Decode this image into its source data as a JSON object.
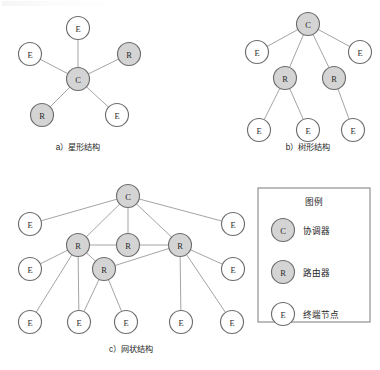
{
  "figure": {
    "captions": {
      "star": "a）星形结构",
      "tree": "b）树形结构",
      "mesh": "c）网状结构"
    },
    "node_symbols": {
      "coordinator": "C",
      "router": "R",
      "endnode": "E"
    },
    "colors": {
      "filled_node": "#d4d4d4",
      "empty_node": "#ffffff",
      "node_stroke": "#6e6e6e",
      "edge": "#9a9a9a",
      "text": "#1f1f1f",
      "legend_border": "#7a7a7a"
    }
  },
  "legend": {
    "title": "图例",
    "entries": [
      {
        "symbol": "C",
        "label": "协调器",
        "type": "coordinator"
      },
      {
        "symbol": "R",
        "label": "路由器",
        "type": "router"
      },
      {
        "symbol": "E",
        "label": "终端节点",
        "type": "endnode"
      }
    ]
  },
  "chart_data": {
    "type": "diagram",
    "subfigures": [
      {
        "id": "star",
        "caption": "a）星形结构",
        "caption_pos": {
          "x": 78,
          "y": 150
        },
        "nodes": [
          {
            "id": "s_c",
            "label": "C",
            "type": "coordinator",
            "x": 78,
            "y": 79
          },
          {
            "id": "s_e1",
            "label": "E",
            "type": "endnode",
            "x": 78,
            "y": 28
          },
          {
            "id": "s_e2",
            "label": "E",
            "type": "endnode",
            "x": 30,
            "y": 54
          },
          {
            "id": "s_r1",
            "label": "R",
            "type": "router",
            "x": 129,
            "y": 54
          },
          {
            "id": "s_r2",
            "label": "R",
            "type": "router",
            "x": 42,
            "y": 115
          },
          {
            "id": "s_e3",
            "label": "E",
            "type": "endnode",
            "x": 117,
            "y": 115
          }
        ],
        "edges": [
          [
            "s_c",
            "s_e1"
          ],
          [
            "s_c",
            "s_e2"
          ],
          [
            "s_c",
            "s_r1"
          ],
          [
            "s_c",
            "s_r2"
          ],
          [
            "s_c",
            "s_e3"
          ]
        ]
      },
      {
        "id": "tree",
        "caption": "b）树形结构",
        "caption_pos": {
          "x": 308,
          "y": 150
        },
        "nodes": [
          {
            "id": "t_c",
            "label": "C",
            "type": "coordinator",
            "x": 308,
            "y": 24
          },
          {
            "id": "t_e1",
            "label": "E",
            "type": "endnode",
            "x": 257,
            "y": 52
          },
          {
            "id": "t_e2",
            "label": "E",
            "type": "endnode",
            "x": 360,
            "y": 52
          },
          {
            "id": "t_r1",
            "label": "R",
            "type": "router",
            "x": 285,
            "y": 78
          },
          {
            "id": "t_r2",
            "label": "R",
            "type": "router",
            "x": 334,
            "y": 78
          },
          {
            "id": "t_e3",
            "label": "E",
            "type": "endnode",
            "x": 259,
            "y": 130
          },
          {
            "id": "t_e4",
            "label": "E",
            "type": "endnode",
            "x": 308,
            "y": 130
          },
          {
            "id": "t_e5",
            "label": "E",
            "type": "endnode",
            "x": 353,
            "y": 130
          }
        ],
        "edges": [
          [
            "t_c",
            "t_e1"
          ],
          [
            "t_c",
            "t_e2"
          ],
          [
            "t_c",
            "t_r1"
          ],
          [
            "t_c",
            "t_r2"
          ],
          [
            "t_r1",
            "t_e3"
          ],
          [
            "t_r1",
            "t_e4"
          ],
          [
            "t_r2",
            "t_e5"
          ]
        ]
      },
      {
        "id": "mesh",
        "caption": "c）网状结构",
        "caption_pos": {
          "x": 131,
          "y": 352
        },
        "nodes": [
          {
            "id": "m_c",
            "label": "C",
            "type": "coordinator",
            "x": 128,
            "y": 196
          },
          {
            "id": "m_e1",
            "label": "E",
            "type": "endnode",
            "x": 30,
            "y": 224
          },
          {
            "id": "m_e2",
            "label": "E",
            "type": "endnode",
            "x": 233,
            "y": 224
          },
          {
            "id": "m_r1",
            "label": "R",
            "type": "router",
            "x": 78,
            "y": 245
          },
          {
            "id": "m_r2",
            "label": "R",
            "type": "router",
            "x": 128,
            "y": 245
          },
          {
            "id": "m_r3",
            "label": "R",
            "type": "router",
            "x": 180,
            "y": 245
          },
          {
            "id": "m_r4",
            "label": "R",
            "type": "router",
            "x": 104,
            "y": 269
          },
          {
            "id": "m_e3",
            "label": "E",
            "type": "endnode",
            "x": 30,
            "y": 269
          },
          {
            "id": "m_e4",
            "label": "E",
            "type": "endnode",
            "x": 233,
            "y": 269
          },
          {
            "id": "m_e5",
            "label": "E",
            "type": "endnode",
            "x": 30,
            "y": 322
          },
          {
            "id": "m_e6",
            "label": "E",
            "type": "endnode",
            "x": 79,
            "y": 322
          },
          {
            "id": "m_e7",
            "label": "E",
            "type": "endnode",
            "x": 126,
            "y": 322
          },
          {
            "id": "m_e8",
            "label": "E",
            "type": "endnode",
            "x": 181,
            "y": 322
          },
          {
            "id": "m_e9",
            "label": "E",
            "type": "endnode",
            "x": 232,
            "y": 322
          }
        ],
        "edges": [
          [
            "m_c",
            "m_e1"
          ],
          [
            "m_c",
            "m_e2"
          ],
          [
            "m_c",
            "m_r1"
          ],
          [
            "m_c",
            "m_r2"
          ],
          [
            "m_c",
            "m_r3"
          ],
          [
            "m_r1",
            "m_r2"
          ],
          [
            "m_r2",
            "m_r3"
          ],
          [
            "m_r1",
            "m_r4"
          ],
          [
            "m_r4",
            "m_r3"
          ],
          [
            "m_r1",
            "m_e3"
          ],
          [
            "m_r1",
            "m_e5"
          ],
          [
            "m_r1",
            "m_e6"
          ],
          [
            "m_r4",
            "m_e6"
          ],
          [
            "m_r4",
            "m_e7"
          ],
          [
            "m_r3",
            "m_e4"
          ],
          [
            "m_r3",
            "m_e8"
          ],
          [
            "m_r3",
            "m_e9"
          ]
        ]
      }
    ],
    "legend_box": {
      "x": 258,
      "y": 188,
      "width": 112,
      "height": 134
    }
  }
}
